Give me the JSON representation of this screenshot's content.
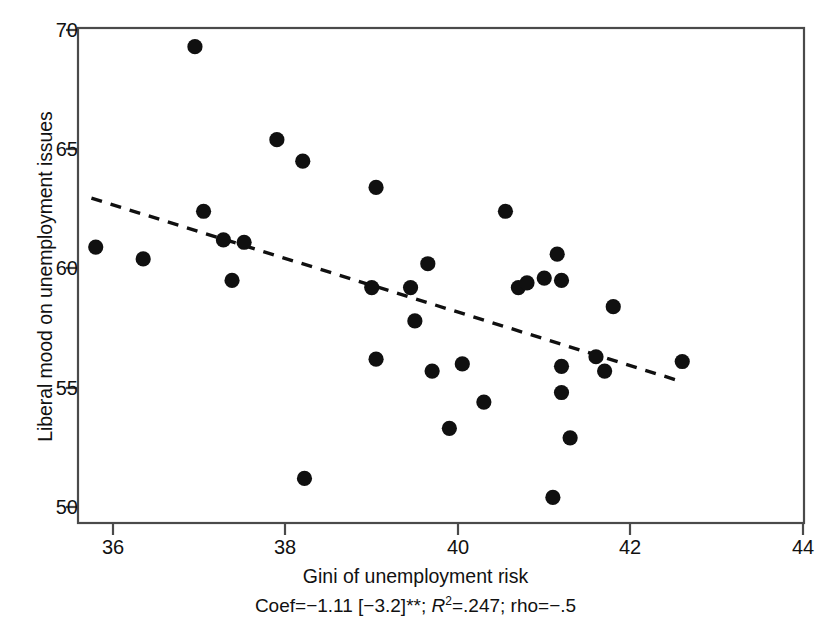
{
  "chart_data": {
    "type": "scatter",
    "title": "",
    "xlabel": "Gini of unemployment risk",
    "ylabel": "Liberal mood on unemployment issues",
    "xlim": [
      35.3,
      44.4
    ],
    "ylim": [
      49.2,
      70.6
    ],
    "xticks": [
      36,
      38,
      40,
      42,
      44
    ],
    "xticklabels": [
      "36",
      "38",
      "40",
      "42",
      "44"
    ],
    "yticks": [
      50,
      55,
      60,
      65,
      70
    ],
    "yticklabels": [
      "50",
      "55",
      "60",
      "65",
      "70"
    ],
    "grid": false,
    "legend": null,
    "marker": "filled-circle",
    "marker_color": "#101010",
    "points": [
      {
        "x": 35.8,
        "y": 60.9
      },
      {
        "x": 36.35,
        "y": 60.4
      },
      {
        "x": 36.95,
        "y": 69.3
      },
      {
        "x": 37.05,
        "y": 62.4
      },
      {
        "x": 37.28,
        "y": 61.2
      },
      {
        "x": 37.38,
        "y": 59.5
      },
      {
        "x": 37.52,
        "y": 61.1
      },
      {
        "x": 37.9,
        "y": 65.4
      },
      {
        "x": 38.2,
        "y": 64.5
      },
      {
        "x": 38.22,
        "y": 51.2
      },
      {
        "x": 39.0,
        "y": 59.2
      },
      {
        "x": 39.05,
        "y": 63.4
      },
      {
        "x": 39.05,
        "y": 56.2
      },
      {
        "x": 39.45,
        "y": 59.2
      },
      {
        "x": 39.5,
        "y": 57.8
      },
      {
        "x": 39.65,
        "y": 60.2
      },
      {
        "x": 39.7,
        "y": 55.7
      },
      {
        "x": 39.9,
        "y": 53.3
      },
      {
        "x": 40.05,
        "y": 56.0
      },
      {
        "x": 40.3,
        "y": 54.4
      },
      {
        "x": 40.55,
        "y": 62.4
      },
      {
        "x": 40.7,
        "y": 59.2
      },
      {
        "x": 40.8,
        "y": 59.4
      },
      {
        "x": 41.0,
        "y": 59.6
      },
      {
        "x": 41.15,
        "y": 60.6
      },
      {
        "x": 41.2,
        "y": 59.5
      },
      {
        "x": 41.2,
        "y": 55.9
      },
      {
        "x": 41.2,
        "y": 54.8
      },
      {
        "x": 41.1,
        "y": 50.4
      },
      {
        "x": 41.3,
        "y": 52.9
      },
      {
        "x": 41.6,
        "y": 56.3
      },
      {
        "x": 41.7,
        "y": 55.7
      },
      {
        "x": 41.8,
        "y": 58.4
      },
      {
        "x": 42.6,
        "y": 56.1
      }
    ],
    "fit_line": {
      "style": "dashed",
      "color": "#101010",
      "x_start": 35.75,
      "y_start": 62.95,
      "x_end": 42.6,
      "y_end": 55.25
    },
    "annotation": {
      "coef_label": "Coef",
      "coef_value": "−1.11",
      "t_stat": "[−3.2]**",
      "r2_label": "R",
      "r2_exp": "2",
      "r2_value": ".247",
      "rho_label": "rho",
      "rho_value": "−.5",
      "full_text": "Coef=−1.11 [−3.2]**; R2=.247; rho=−.5"
    }
  },
  "axes": {
    "frame_color": "#3a3a3a",
    "background": "#ffffff"
  }
}
